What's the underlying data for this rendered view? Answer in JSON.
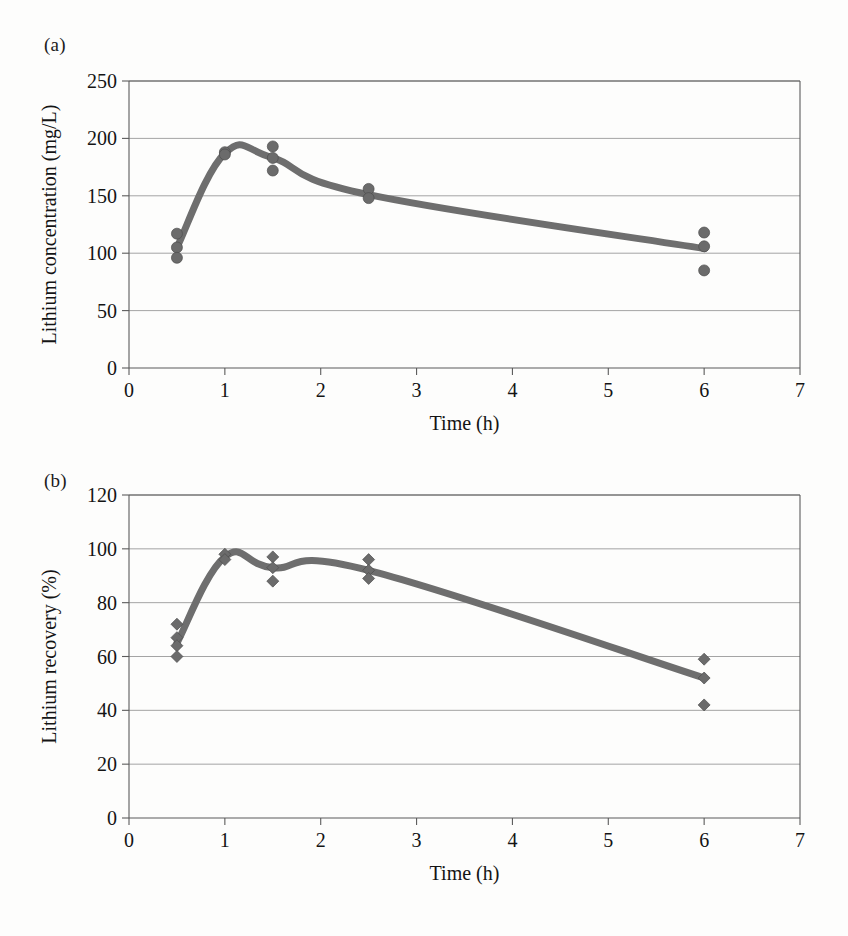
{
  "figure": {
    "background_color": "#fdfdfc",
    "series_color": "#6e6e6e",
    "marker_color": "#6b6b6b",
    "axis_color": "#5b5b5b",
    "grid_color": "#9a9a9a"
  },
  "panels": [
    {
      "id": "a",
      "label": "(a)",
      "chart_data": {
        "type": "scatter",
        "title": "",
        "xlabel": "Time (h)",
        "ylabel": "Lithium concentration (mg/L)",
        "xlim": [
          0,
          7
        ],
        "ylim": [
          0,
          250
        ],
        "xticks": [
          0,
          1,
          2,
          3,
          4,
          5,
          6,
          7
        ],
        "yticks": [
          0,
          50,
          100,
          150,
          200,
          250
        ],
        "xtick_labels": [
          "0",
          "1",
          "2",
          "3",
          "4",
          "5",
          "6",
          "7"
        ],
        "ytick_labels": [
          "0",
          "50",
          "100",
          "150",
          "200",
          "250"
        ],
        "grid": "horizontal",
        "legend": "none",
        "marker": "circle",
        "marker_size": 11,
        "line_width": 7,
        "x": [
          0.5,
          1.0,
          1.5,
          2.5,
          6.0
        ],
        "mean_values": [
          105,
          187,
          183,
          151,
          104
        ],
        "replicates": [
          {
            "x": 0.5,
            "values": [
              117,
              105,
              96
            ]
          },
          {
            "x": 1.0,
            "values": [
              188,
              186
            ]
          },
          {
            "x": 1.5,
            "values": [
              193,
              183,
              172
            ]
          },
          {
            "x": 2.5,
            "values": [
              156,
              148
            ]
          },
          {
            "x": 6.0,
            "values": [
              118,
              106,
              85
            ]
          }
        ]
      }
    },
    {
      "id": "b",
      "label": "(b)",
      "chart_data": {
        "type": "scatter",
        "title": "",
        "xlabel": "Time (h)",
        "ylabel": "Lithium recovery (%)",
        "xlim": [
          0,
          7
        ],
        "ylim": [
          0,
          120
        ],
        "xticks": [
          0,
          1,
          2,
          3,
          4,
          5,
          6,
          7
        ],
        "yticks": [
          0,
          20,
          40,
          60,
          80,
          100,
          120
        ],
        "xtick_labels": [
          "0",
          "1",
          "2",
          "3",
          "4",
          "5",
          "6",
          "7"
        ],
        "ytick_labels": [
          "0",
          "20",
          "40",
          "60",
          "80",
          "100",
          "120"
        ],
        "grid": "horizontal",
        "legend": "none",
        "marker": "diamond",
        "marker_size": 9,
        "line_width": 7,
        "x": [
          0.5,
          1.0,
          1.5,
          2.5,
          6.0
        ],
        "mean_values": [
          65,
          97,
          93,
          92,
          52
        ],
        "replicates": [
          {
            "x": 0.5,
            "values": [
              72,
              67,
              64,
              60
            ]
          },
          {
            "x": 1.0,
            "values": [
              98,
              96
            ]
          },
          {
            "x": 1.5,
            "values": [
              97,
              93,
              88
            ]
          },
          {
            "x": 2.5,
            "values": [
              96,
              92,
              89
            ]
          },
          {
            "x": 6.0,
            "values": [
              59,
              52,
              42
            ]
          }
        ]
      }
    }
  ]
}
